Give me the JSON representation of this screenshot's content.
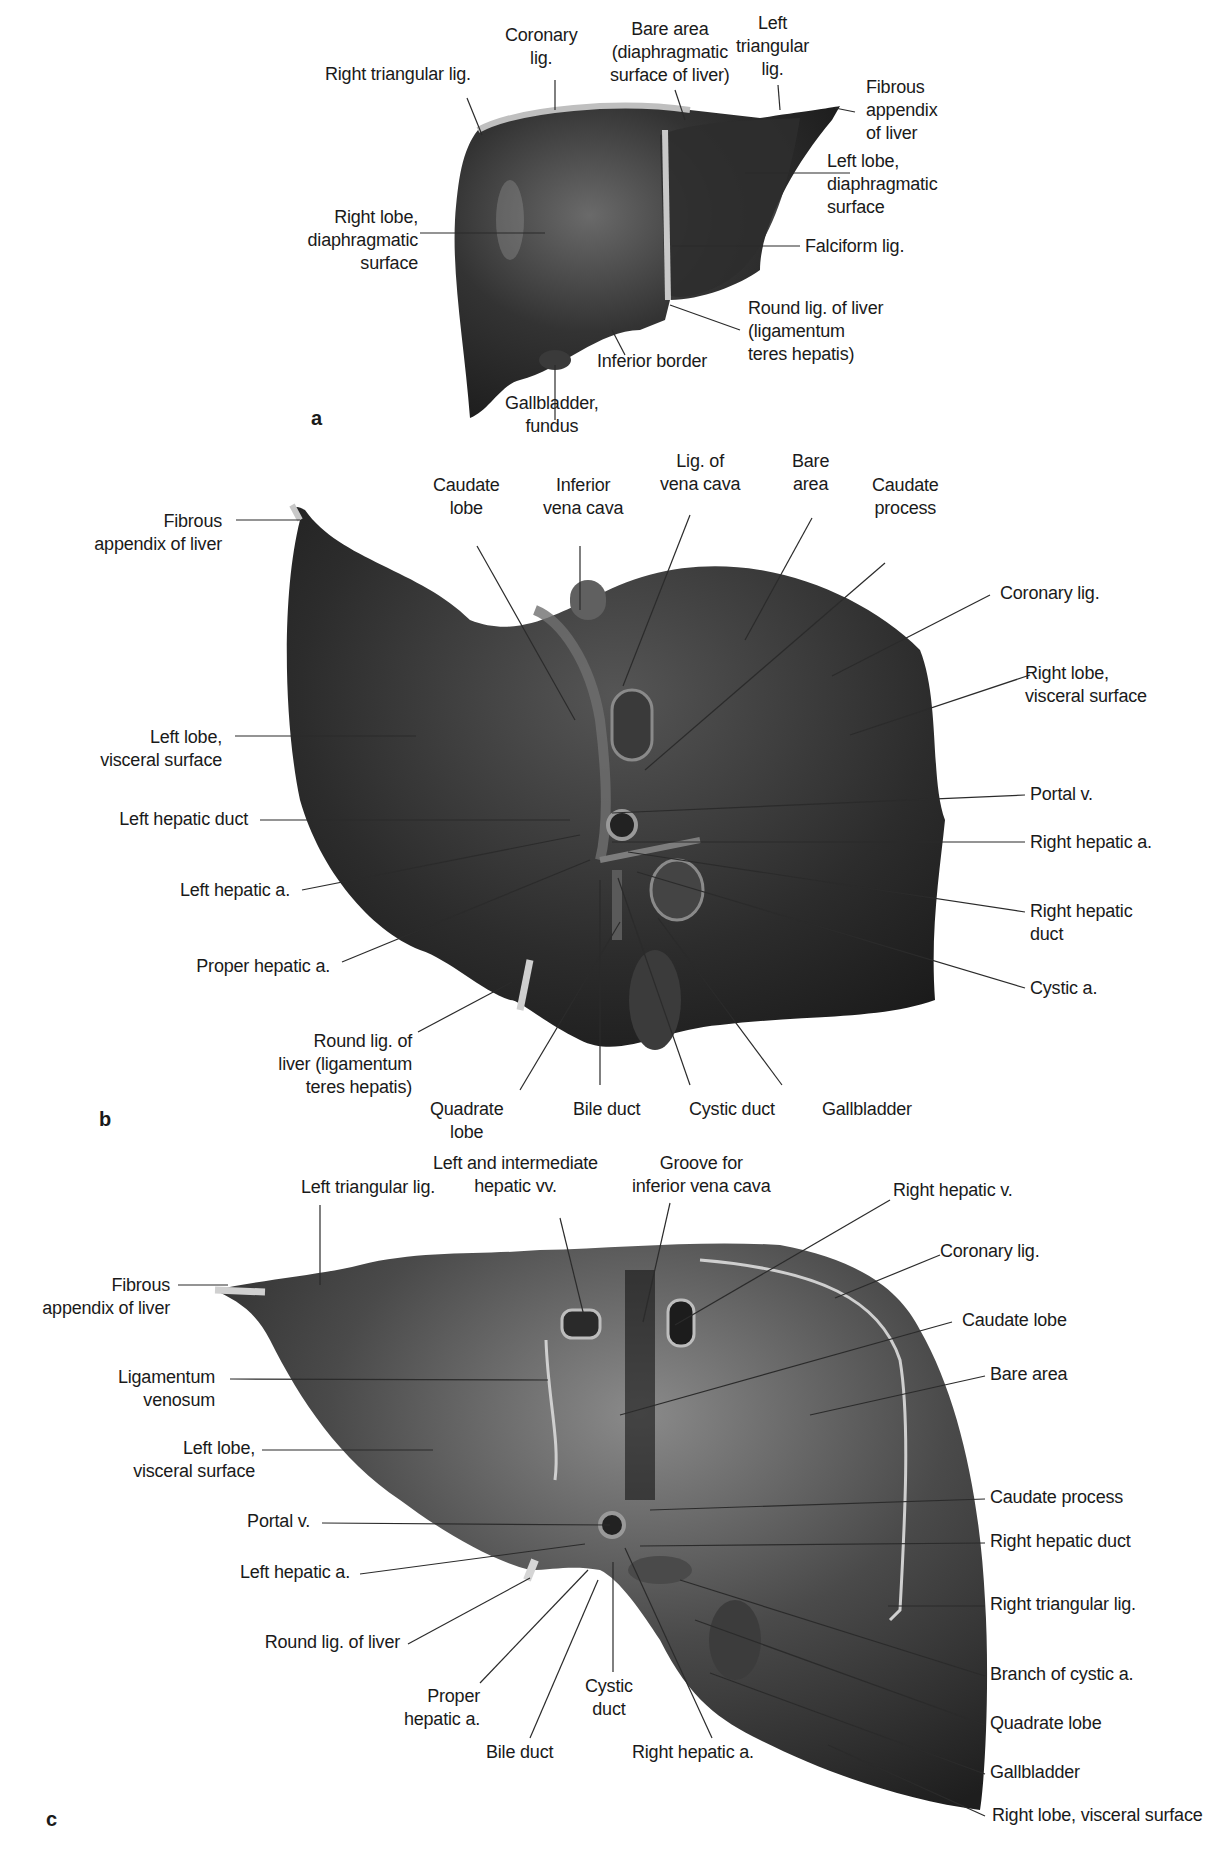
{
  "figure": {
    "colors": {
      "organ_dark": "#262626",
      "organ_mid": "#4a4a4a",
      "highlight": "#9a9a9a",
      "ligament": "#c8c8c8",
      "leader": "#2b2b2b",
      "text": "#1a1a1a"
    },
    "panels": [
      {
        "letter": "a",
        "view": "anterior (diaphragmatic surface)",
        "labels": [
          {
            "id": "a-coronary",
            "lines": [
              "Coronary",
              "lig."
            ]
          },
          {
            "id": "a-bare-area",
            "lines": [
              "Bare area",
              "(diaphragmatic",
              "surface of liver)"
            ]
          },
          {
            "id": "a-left-triangular",
            "lines": [
              "Left",
              "triangular",
              "lig."
            ]
          },
          {
            "id": "a-right-triangular",
            "lines": [
              "Right triangular lig."
            ]
          },
          {
            "id": "a-fibrous-appendix",
            "lines": [
              "Fibrous",
              "appendix",
              "of liver"
            ]
          },
          {
            "id": "a-left-lobe",
            "lines": [
              "Left lobe,",
              "diaphragmatic",
              "surface"
            ]
          },
          {
            "id": "a-right-lobe",
            "lines": [
              "Right lobe,",
              "diaphragmatic",
              "surface"
            ]
          },
          {
            "id": "a-falciform",
            "lines": [
              "Falciform lig."
            ]
          },
          {
            "id": "a-round-lig",
            "lines": [
              "Round lig. of liver",
              "(ligamentum",
              "teres hepatis)"
            ]
          },
          {
            "id": "a-inferior-border",
            "lines": [
              "Inferior border"
            ]
          },
          {
            "id": "a-gallbladder",
            "lines": [
              "Gallbladder,",
              "fundus"
            ]
          }
        ]
      },
      {
        "letter": "b",
        "view": "inferior (visceral surface)",
        "labels": [
          {
            "id": "b-fibrous-appendix",
            "lines": [
              "Fibrous",
              "appendix of liver"
            ]
          },
          {
            "id": "b-caudate-lobe",
            "lines": [
              "Caudate",
              "lobe"
            ]
          },
          {
            "id": "b-ivc",
            "lines": [
              "Inferior",
              "vena cava"
            ]
          },
          {
            "id": "b-lig-vena-cava",
            "lines": [
              "Lig. of",
              "vena cava"
            ]
          },
          {
            "id": "b-bare-area",
            "lines": [
              "Bare",
              "area"
            ]
          },
          {
            "id": "b-caudate-process",
            "lines": [
              "Caudate",
              "process"
            ]
          },
          {
            "id": "b-coronary",
            "lines": [
              "Coronary lig."
            ]
          },
          {
            "id": "b-right-lobe",
            "lines": [
              "Right lobe,",
              "visceral surface"
            ]
          },
          {
            "id": "b-left-lobe",
            "lines": [
              "Left lobe,",
              "visceral surface"
            ]
          },
          {
            "id": "b-left-hepatic-duct",
            "lines": [
              "Left hepatic duct"
            ]
          },
          {
            "id": "b-portal-v",
            "lines": [
              "Portal v."
            ]
          },
          {
            "id": "b-right-hepatic-a",
            "lines": [
              "Right hepatic a."
            ]
          },
          {
            "id": "b-left-hepatic-a",
            "lines": [
              "Left hepatic a."
            ]
          },
          {
            "id": "b-right-hepatic-duct",
            "lines": [
              "Right hepatic",
              "duct"
            ]
          },
          {
            "id": "b-proper-hepatic-a",
            "lines": [
              "Proper hepatic a."
            ]
          },
          {
            "id": "b-cystic-a",
            "lines": [
              "Cystic a."
            ]
          },
          {
            "id": "b-round-lig",
            "lines": [
              "Round lig. of",
              "liver (ligamentum",
              "teres hepatis)"
            ]
          },
          {
            "id": "b-quadrate-lobe",
            "lines": [
              "Quadrate",
              "lobe"
            ]
          },
          {
            "id": "b-bile-duct",
            "lines": [
              "Bile duct"
            ]
          },
          {
            "id": "b-cystic-duct",
            "lines": [
              "Cystic duct"
            ]
          },
          {
            "id": "b-gallbladder",
            "lines": [
              "Gallbladder"
            ]
          }
        ]
      },
      {
        "letter": "c",
        "view": "posterior view",
        "labels": [
          {
            "id": "c-left-triangular",
            "lines": [
              "Left triangular lig."
            ]
          },
          {
            "id": "c-hepatic-vv",
            "lines": [
              "Left and intermediate",
              "hepatic vv."
            ]
          },
          {
            "id": "c-groove-ivc",
            "lines": [
              "Groove for",
              "inferior vena cava"
            ]
          },
          {
            "id": "c-right-hepatic-v",
            "lines": [
              "Right hepatic v."
            ]
          },
          {
            "id": "c-fibrous-appendix",
            "lines": [
              "Fibrous",
              "appendix of liver"
            ]
          },
          {
            "id": "c-coronary",
            "lines": [
              "Coronary lig."
            ]
          },
          {
            "id": "c-caudate-lobe",
            "lines": [
              "Caudate lobe"
            ]
          },
          {
            "id": "c-lig-venosum",
            "lines": [
              "Ligamentum",
              "venosum"
            ]
          },
          {
            "id": "c-bare-area",
            "lines": [
              "Bare area"
            ]
          },
          {
            "id": "c-left-lobe",
            "lines": [
              "Left lobe,",
              "visceral surface"
            ]
          },
          {
            "id": "c-caudate-process",
            "lines": [
              "Caudate process"
            ]
          },
          {
            "id": "c-portal-v",
            "lines": [
              "Portal v."
            ]
          },
          {
            "id": "c-right-hepatic-duct",
            "lines": [
              "Right hepatic duct"
            ]
          },
          {
            "id": "c-left-hepatic-a",
            "lines": [
              "Left hepatic a."
            ]
          },
          {
            "id": "c-right-triangular",
            "lines": [
              "Right triangular lig."
            ]
          },
          {
            "id": "c-round-lig",
            "lines": [
              "Round lig. of liver"
            ]
          },
          {
            "id": "c-branch-cystic-a",
            "lines": [
              "Branch of cystic a."
            ]
          },
          {
            "id": "c-proper-hepatic-a",
            "lines": [
              "Proper",
              "hepatic a."
            ]
          },
          {
            "id": "c-cystic-duct",
            "lines": [
              "Cystic",
              "duct"
            ]
          },
          {
            "id": "c-quadrate-lobe",
            "lines": [
              "Quadrate lobe"
            ]
          },
          {
            "id": "c-bile-duct",
            "lines": [
              "Bile duct"
            ]
          },
          {
            "id": "c-right-hepatic-a",
            "lines": [
              "Right hepatic a."
            ]
          },
          {
            "id": "c-gallbladder",
            "lines": [
              "Gallbladder"
            ]
          },
          {
            "id": "c-right-lobe",
            "lines": [
              "Right lobe, visceral surface"
            ]
          }
        ]
      }
    ]
  }
}
